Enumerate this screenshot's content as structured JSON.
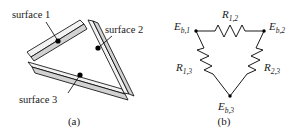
{
  "figure": {
    "panels": [
      {
        "id": "a",
        "caption": "(a)",
        "description": "Three-surface enclosure formed by three gray plates arranged as a triangle",
        "labels": [
          {
            "id": "surface-1",
            "text": "surface 1"
          },
          {
            "id": "surface-2",
            "text": "surface 2"
          },
          {
            "id": "surface-3",
            "text": "surface 3"
          }
        ]
      },
      {
        "id": "b",
        "caption": "(b)",
        "description": "Equivalent radiation network: three blackbody emissive power nodes joined by three space resistances",
        "nodes": [
          {
            "id": "node-eb1",
            "symbol": "E",
            "subscript": "b,1"
          },
          {
            "id": "node-eb2",
            "symbol": "E",
            "subscript": "b,2"
          },
          {
            "id": "node-eb3",
            "symbol": "E",
            "subscript": "b,3"
          }
        ],
        "resistors": [
          {
            "id": "resistor-r12",
            "symbol": "R",
            "subscript": "1,2"
          },
          {
            "id": "resistor-r13",
            "symbol": "R",
            "subscript": "1,3"
          },
          {
            "id": "resistor-r23",
            "symbol": "R",
            "subscript": "2,3"
          }
        ]
      }
    ]
  },
  "colors": {
    "plate_face": "#d2d2d2",
    "plate_edge": "#f2f2f2",
    "outline": "#000000",
    "text": "#1a1a1a",
    "background": "#ffffff"
  }
}
